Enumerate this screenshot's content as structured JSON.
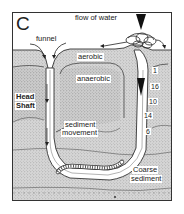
{
  "figure": {
    "panel_label": "C",
    "labels": {
      "flow": "flow of water",
      "funnel": "funnel",
      "aerobic": "aerobic",
      "anaerobic": "anaerobic",
      "head_shaft_line1": "Head",
      "head_shaft_line2": "Shaft",
      "sediment_movement_line1": "sediment",
      "sediment_movement_line2": "movement",
      "coarse_line1": "Coarse",
      "coarse_line2": "sediment"
    },
    "depth_markers": [
      "1",
      "16",
      "10",
      "14",
      "6"
    ],
    "colors": {
      "background": "#ffffff",
      "sediment": "#cfcfcf",
      "ink": "#222222",
      "burrow": "#ffffff"
    }
  }
}
